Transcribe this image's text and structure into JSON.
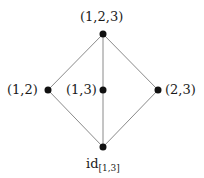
{
  "diagram": {
    "type": "hasse-diagram",
    "nodes": [
      {
        "id": "top",
        "label": "(1,2,3)",
        "x": 103,
        "y": 34
      },
      {
        "id": "left",
        "label": "(1,2)",
        "x": 48,
        "y": 90
      },
      {
        "id": "middle",
        "label": "(1,3)",
        "x": 103,
        "y": 90
      },
      {
        "id": "right",
        "label": "(2,3)",
        "x": 158,
        "y": 90
      },
      {
        "id": "bottom",
        "label": "id",
        "label_sub": "[1,3]",
        "x": 103,
        "y": 147
      }
    ],
    "edges": [
      [
        "top",
        "left"
      ],
      [
        "top",
        "middle"
      ],
      [
        "top",
        "right"
      ],
      [
        "left",
        "bottom"
      ],
      [
        "middle",
        "bottom"
      ],
      [
        "right",
        "bottom"
      ]
    ],
    "colors": {
      "edge": "#8a8a8a",
      "node": "#111111",
      "text": "#1a1a1a"
    }
  }
}
